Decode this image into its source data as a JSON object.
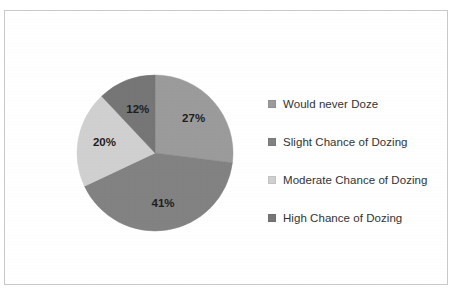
{
  "document": {
    "top_clipped_text": "· · ·",
    "frame_color": "#c9c9c9",
    "background_color": "#ffffff"
  },
  "chart_data": {
    "type": "pie",
    "title": "",
    "subtitle": "",
    "xlabel": "",
    "ylabel": "",
    "legend_position": "right",
    "grid": false,
    "start_angle_deg": 0,
    "direction": "clockwise",
    "categories": [
      "Would never Doze",
      "Slight Chance of Dozing",
      "Moderate Chance of Dozing",
      "High Chance of Dozing"
    ],
    "values": [
      27,
      41,
      20,
      12
    ],
    "value_unit": "%",
    "data_labels": [
      "27%",
      "41%",
      "20%",
      "12%"
    ],
    "colors": [
      "#9b9b9b",
      "#828282",
      "#d0d0d0",
      "#767676"
    ],
    "slices": [
      {
        "label": "Would never Doze",
        "value": 27,
        "display": "27%",
        "color": "#9b9b9b"
      },
      {
        "label": "Slight Chance of Dozing",
        "value": 41,
        "display": "41%",
        "color": "#828282"
      },
      {
        "label": "Moderate Chance of Dozing",
        "value": 20,
        "display": "20%",
        "color": "#d0d0d0"
      },
      {
        "label": "High Chance of Dozing",
        "value": 12,
        "display": "12%",
        "color": "#767676"
      }
    ]
  },
  "legend": {
    "items": [
      {
        "label": "Would never Doze",
        "color": "#9b9b9b"
      },
      {
        "label": "Slight Chance of Dozing",
        "color": "#828282"
      },
      {
        "label": "Moderate Chance of Dozing",
        "color": "#d0d0d0"
      },
      {
        "label": "High Chance of Dozing",
        "color": "#767676"
      }
    ]
  }
}
